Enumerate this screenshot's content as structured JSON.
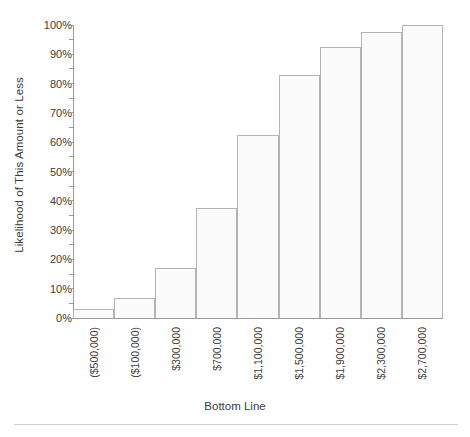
{
  "chart_data": {
    "type": "bar",
    "title": "",
    "subtitle": "",
    "xlabel": "Bottom Line",
    "ylabel": "Likelihood of This Amount or Less",
    "categories": [
      "($500,000)",
      "($100,000)",
      "$300,000",
      "$700,000",
      "$1,100,000",
      "$1,500,000",
      "$1,900,000",
      "$2,300,000",
      "$2,700,000"
    ],
    "values": [
      3,
      7,
      17,
      37.5,
      62.5,
      83,
      92.5,
      97.5,
      100
    ],
    "value_labels": [
      "3%",
      "7%",
      "17%",
      "37.5%",
      "62.5%",
      "83%",
      "92.5%",
      "97.5%",
      "100%"
    ],
    "ylim": [
      0,
      100
    ],
    "ytick_labels": [
      "0%",
      "10%",
      "20%",
      "30%",
      "40%",
      "50%",
      "60%",
      "70%",
      "80%",
      "90%",
      "100%"
    ],
    "ytick_values": [
      0,
      10,
      20,
      30,
      40,
      50,
      60,
      70,
      80,
      90,
      100
    ],
    "yminor_step": 5,
    "grid": false,
    "legend": false,
    "legend_position": "none",
    "bar_fill_color": "#fbfbfb",
    "bar_border_color": "#b4b4b4",
    "axis_color": "#9a9a9a",
    "text_color": "#3d3d3d"
  }
}
